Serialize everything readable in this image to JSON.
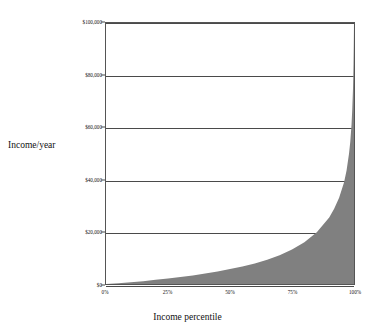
{
  "chart_data": {
    "type": "area",
    "title": "",
    "subtitle": "",
    "xlabel": "Income percentile",
    "ylabel": "Income/year",
    "xlim": [
      0,
      100
    ],
    "ylim": [
      0,
      100000
    ],
    "grid": true,
    "legend": null,
    "legend_position": "none",
    "fill_color": "#808080",
    "line_color": "#808080",
    "y_tick_labels": [
      "$0",
      "$20,000",
      "$40,000",
      "$60,000",
      "$80,000",
      "$100,000"
    ],
    "y_tick_values": [
      0,
      20000,
      40000,
      60000,
      80000,
      100000
    ],
    "x_tick_labels": [
      "0%",
      "25%",
      "50%",
      "75%",
      "100%"
    ],
    "x_tick_values": [
      0,
      25,
      50,
      75,
      100
    ],
    "x": [
      0,
      5,
      10,
      15,
      20,
      25,
      30,
      35,
      40,
      45,
      50,
      55,
      60,
      65,
      70,
      75,
      80,
      85,
      90,
      92,
      94,
      96,
      97,
      98,
      98.5,
      99,
      99.3,
      99.6,
      99.8,
      99.9,
      100
    ],
    "values": [
      0,
      300,
      700,
      1100,
      1600,
      2100,
      2700,
      3300,
      4000,
      4800,
      5700,
      6700,
      7900,
      9300,
      11000,
      13200,
      16000,
      19800,
      25500,
      28800,
      33000,
      39000,
      43500,
      50000,
      54500,
      61000,
      67000,
      75000,
      84000,
      91000,
      100000
    ],
    "series": [
      {
        "name": "Income/year",
        "values": [
          0,
          300,
          700,
          1100,
          1600,
          2100,
          2700,
          3300,
          4000,
          4800,
          5700,
          6700,
          7900,
          9300,
          11000,
          13200,
          16000,
          19800,
          25500,
          28800,
          33000,
          39000,
          43500,
          50000,
          54500,
          61000,
          67000,
          75000,
          84000,
          91000,
          100000
        ]
      }
    ]
  }
}
